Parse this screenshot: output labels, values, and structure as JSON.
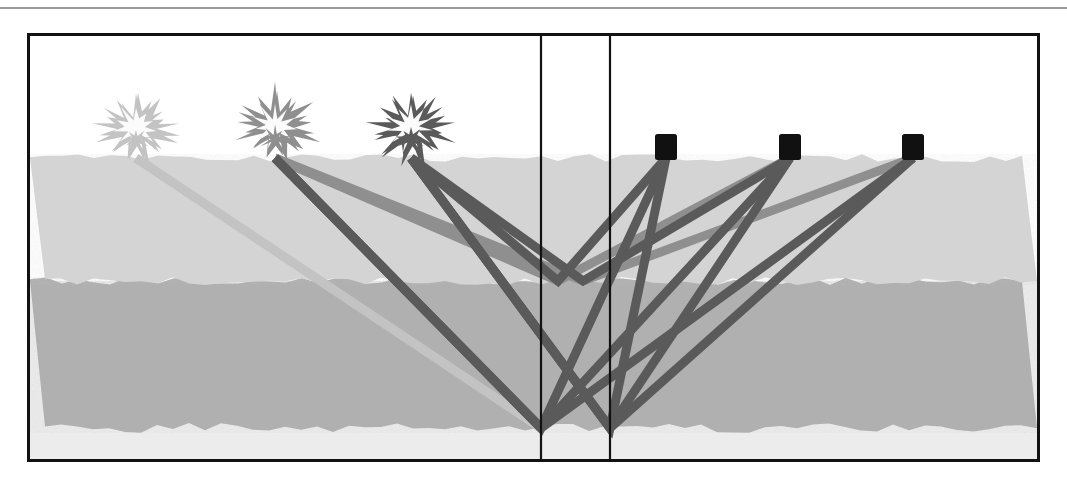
{
  "figure": {
    "frame": {
      "x": 27,
      "y": 33,
      "width": 1013,
      "height": 429,
      "border_color": "#121212",
      "border_width": 3
    },
    "top_rule": {
      "y": 7,
      "color": "#9a9a9a",
      "height": 2
    }
  },
  "palette": {
    "air": "#ffffff",
    "layer1": "#d4d4d4",
    "layer2": "#b0b0b0",
    "layer3": "#ececec",
    "ray_light": "#c3c3c3",
    "ray_medium": "#8f8f8f",
    "ray_dark": "#5a5a5a",
    "receiver": "#111111",
    "line": "#121212"
  },
  "layers": [
    {
      "name": "air",
      "label": "air",
      "color": "#ffffff",
      "top": 0,
      "bottom": 122
    },
    {
      "name": "layer-1",
      "label": "upper layer",
      "color": "#d4d4d4",
      "top": 122,
      "bottom": 245
    },
    {
      "name": "layer-2",
      "label": "middle layer",
      "color": "#b0b0b0",
      "top": 245,
      "bottom": 392
    },
    {
      "name": "layer-3",
      "label": "lower layer",
      "color": "#ececec",
      "top": 392,
      "bottom": 423
    }
  ],
  "interfaces": [
    {
      "name": "ground-surface",
      "depth": 122
    },
    {
      "name": "shallow-reflector",
      "depth": 245
    },
    {
      "name": "deep-reflector",
      "depth": 392
    }
  ],
  "vertical_lines": [
    {
      "name": "midpoint-line-left",
      "x": 511
    },
    {
      "name": "midpoint-line-right",
      "x": 580
    }
  ],
  "sources": [
    {
      "id": "shot-1",
      "label": "shot point 1",
      "x": 106,
      "y": 122,
      "shade": "light",
      "color": "#c3c3c3",
      "size": 62
    },
    {
      "id": "shot-2",
      "label": "shot point 2",
      "x": 245,
      "y": 122,
      "shade": "medium",
      "color": "#8f8f8f",
      "size": 66
    },
    {
      "id": "shot-3",
      "label": "shot point 3",
      "x": 381,
      "y": 122,
      "shade": "dark",
      "color": "#5a5a5a",
      "size": 64
    }
  ],
  "receivers": [
    {
      "id": "receiver-1",
      "label": "geophone 1",
      "x": 636,
      "y": 122,
      "size": 22,
      "color": "#111111"
    },
    {
      "id": "receiver-2",
      "label": "geophone 2",
      "x": 760,
      "y": 122,
      "size": 22,
      "color": "#111111"
    },
    {
      "id": "receiver-3",
      "label": "geophone 3",
      "x": 883,
      "y": 122,
      "size": 22,
      "color": "#111111"
    }
  ],
  "reflection_points": [
    {
      "name": "deep-cmp-left",
      "x": 511,
      "y": 392
    },
    {
      "name": "deep-cmp-right",
      "x": 580,
      "y": 392
    },
    {
      "name": "shallow-cmp-left",
      "x": 528,
      "y": 245
    },
    {
      "name": "shallow-cmp-right",
      "x": 553,
      "y": 245
    }
  ],
  "chart_data": {
    "type": "diagram",
    "ray_paths": [
      {
        "id": "r01",
        "source": "shot-1",
        "receiver": "receiver-3",
        "reflector": "deep-cmp-left",
        "shade": "light",
        "color": "#c3c3c3",
        "width": 9,
        "points": [
          [
            106,
            122
          ],
          [
            511,
            392
          ],
          [
            883,
            122
          ]
        ]
      },
      {
        "id": "r02",
        "source": "shot-1",
        "receiver": "receiver-2",
        "reflector": "deep-cmp-left",
        "shade": "light",
        "color": "#c3c3c3",
        "width": 9,
        "points": [
          [
            106,
            122
          ],
          [
            511,
            392
          ],
          [
            760,
            122
          ]
        ]
      },
      {
        "id": "r03",
        "source": "shot-2",
        "receiver": "receiver-3",
        "reflector": "deep-cmp-left",
        "shade": "dark",
        "color": "#5a5a5a",
        "width": 9,
        "points": [
          [
            245,
            122
          ],
          [
            511,
            392
          ],
          [
            883,
            122
          ]
        ]
      },
      {
        "id": "r04",
        "source": "shot-2",
        "receiver": "receiver-2",
        "reflector": "deep-cmp-left",
        "shade": "dark",
        "color": "#5a5a5a",
        "width": 9,
        "points": [
          [
            245,
            122
          ],
          [
            511,
            392
          ],
          [
            760,
            122
          ]
        ]
      },
      {
        "id": "r05",
        "source": "shot-2",
        "receiver": "receiver-1",
        "reflector": "deep-cmp-left",
        "shade": "dark",
        "color": "#5a5a5a",
        "width": 9,
        "points": [
          [
            245,
            122
          ],
          [
            511,
            392
          ],
          [
            636,
            122
          ]
        ]
      },
      {
        "id": "r06",
        "source": "shot-3",
        "receiver": "receiver-3",
        "reflector": "deep-cmp-right",
        "shade": "dark",
        "color": "#5a5a5a",
        "width": 9,
        "points": [
          [
            381,
            122
          ],
          [
            580,
            392
          ],
          [
            883,
            122
          ]
        ]
      },
      {
        "id": "r07",
        "source": "shot-3",
        "receiver": "receiver-2",
        "reflector": "deep-cmp-right",
        "shade": "dark",
        "color": "#5a5a5a",
        "width": 9,
        "points": [
          [
            381,
            122
          ],
          [
            580,
            392
          ],
          [
            760,
            122
          ]
        ]
      },
      {
        "id": "r08",
        "source": "shot-3",
        "receiver": "receiver-1",
        "reflector": "deep-cmp-right",
        "shade": "dark",
        "color": "#5a5a5a",
        "width": 9,
        "points": [
          [
            381,
            122
          ],
          [
            580,
            392
          ],
          [
            636,
            122
          ]
        ]
      },
      {
        "id": "r09",
        "source": "shot-2",
        "receiver": "receiver-2",
        "reflector": "shallow-cmp-left",
        "shade": "medium",
        "color": "#8f8f8f",
        "width": 9,
        "points": [
          [
            245,
            122
          ],
          [
            528,
            245
          ],
          [
            760,
            122
          ]
        ]
      },
      {
        "id": "r10",
        "source": "shot-3",
        "receiver": "receiver-1",
        "reflector": "shallow-cmp-left",
        "shade": "dark",
        "color": "#5a5a5a",
        "width": 9,
        "points": [
          [
            381,
            122
          ],
          [
            528,
            245
          ],
          [
            636,
            122
          ]
        ]
      },
      {
        "id": "r11",
        "source": "shot-3",
        "receiver": "receiver-2",
        "reflector": "shallow-cmp-right",
        "shade": "dark",
        "color": "#5a5a5a",
        "width": 9,
        "points": [
          [
            381,
            122
          ],
          [
            553,
            245
          ],
          [
            760,
            122
          ]
        ]
      },
      {
        "id": "r12",
        "source": "shot-2",
        "receiver": "receiver-3",
        "reflector": "shallow-cmp-right",
        "shade": "medium",
        "color": "#8f8f8f",
        "width": 9,
        "points": [
          [
            245,
            122
          ],
          [
            553,
            245
          ],
          [
            883,
            122
          ]
        ]
      }
    ]
  }
}
